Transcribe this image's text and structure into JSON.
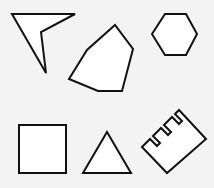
{
  "canvas": {
    "width": 214,
    "height": 188,
    "background": "#f3f3f3"
  },
  "style": {
    "fill": "#ffffff",
    "stroke": "#111111"
  },
  "shapes": [
    {
      "name": "arrowhead",
      "points": "12,14 75,14 41,32 46,73"
    },
    {
      "name": "heptagon",
      "points": "69,79 87,50 115,25 133,49 122,91 98,91"
    },
    {
      "name": "hexagon",
      "points": "152,34 165,14 186,14 197,34 186,55 165,55"
    },
    {
      "name": "square",
      "points": "19,125 66,125 66,173 19,173"
    },
    {
      "name": "triangle",
      "points": "83,173 107,132 131,173"
    },
    {
      "name": "comb",
      "points": "142,147 150,139 157,146 160,143 153,136 161,128 168,135 171,132 164,125 172,117 179,124 182,121 175,114 179,110 206,139 167,173"
    }
  ]
}
